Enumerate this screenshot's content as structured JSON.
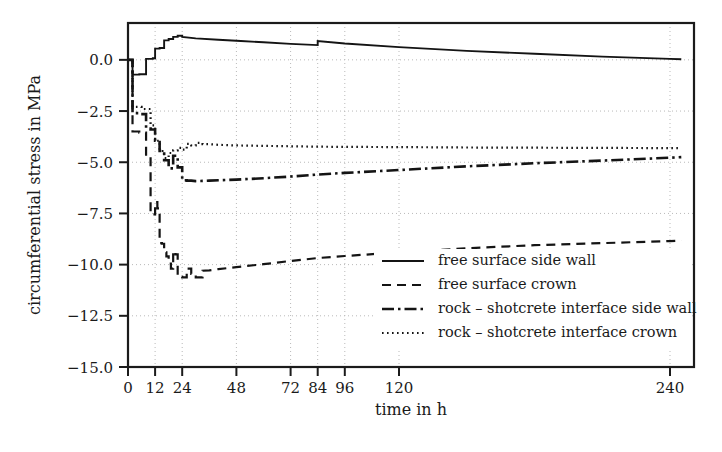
{
  "chart_data": {
    "type": "line",
    "title": "",
    "xlabel": "time in h",
    "ylabel": "circumferential stress in MPa",
    "xlim": [
      0,
      245
    ],
    "ylim": [
      -15.0,
      1.8
    ],
    "grid": true,
    "legend_position": "center-right inside axes",
    "xticks": [
      0,
      12,
      24,
      48,
      72,
      84,
      96,
      120,
      240
    ],
    "xtick_labels": [
      "0",
      "12",
      "24",
      "48",
      "72",
      "84",
      "96",
      "120",
      "240"
    ],
    "yticks": [
      0.0,
      -2.5,
      -5.0,
      -7.5,
      -10.0,
      -12.5,
      -15.0
    ],
    "ytick_labels": [
      "0.0",
      "−2.5",
      "−5.0",
      "−7.5",
      "−10.0",
      "−12.5",
      "−15.0"
    ],
    "series": [
      {
        "name": "free surface side wall",
        "style": "solid",
        "x": [
          0,
          2,
          2,
          5,
          5,
          8,
          8,
          11,
          11,
          12,
          12,
          14,
          14,
          16,
          16,
          18,
          18,
          20,
          20,
          22,
          22,
          24,
          24,
          30,
          40,
          50,
          60,
          72,
          84,
          84,
          96,
          120,
          150,
          180,
          210,
          240,
          245
        ],
        "y": [
          0.0,
          0.0,
          -0.72,
          -0.72,
          -0.7,
          -0.7,
          0.05,
          0.05,
          0.08,
          0.08,
          0.55,
          0.55,
          0.58,
          0.58,
          0.95,
          0.95,
          1.02,
          1.02,
          1.12,
          1.12,
          1.18,
          1.18,
          1.12,
          1.05,
          0.98,
          0.92,
          0.86,
          0.78,
          0.72,
          0.92,
          0.8,
          0.62,
          0.44,
          0.3,
          0.16,
          0.05,
          0.03
        ]
      },
      {
        "name": "free surface crown",
        "style": "dashed",
        "x": [
          0,
          2,
          2,
          5,
          5,
          8,
          8,
          10,
          10,
          12,
          12,
          13,
          13,
          14,
          14,
          15,
          15,
          16,
          16,
          17,
          17,
          18,
          18,
          19,
          19,
          20,
          20,
          21,
          21,
          22,
          22,
          23,
          23,
          24,
          24,
          26,
          26,
          28,
          28,
          30,
          30,
          33,
          33,
          36,
          40,
          48,
          60,
          72,
          84,
          96,
          120,
          150,
          180,
          210,
          240,
          245
        ],
        "y": [
          0.0,
          0.0,
          -3.5,
          -3.5,
          -3.55,
          -3.55,
          -4.7,
          -4.7,
          -7.55,
          -7.55,
          -6.95,
          -6.95,
          -7.25,
          -7.25,
          -8.95,
          -8.95,
          -8.98,
          -8.98,
          -9.4,
          -9.4,
          -9.6,
          -9.6,
          -9.95,
          -9.95,
          -10.2,
          -10.2,
          -9.35,
          -9.35,
          -9.5,
          -9.5,
          -10.55,
          -10.55,
          -10.6,
          -10.6,
          -10.62,
          -10.62,
          -10.2,
          -10.2,
          -10.45,
          -10.45,
          -10.62,
          -10.62,
          -10.3,
          -10.28,
          -10.22,
          -10.12,
          -9.98,
          -9.82,
          -9.68,
          -9.58,
          -9.4,
          -9.2,
          -9.05,
          -8.95,
          -8.85,
          -8.82
        ]
      },
      {
        "name": "rock – shotcrete interface side wall",
        "style": "dashdot",
        "x": [
          0,
          2,
          2,
          5,
          5,
          8,
          8,
          10,
          10,
          12,
          12,
          14,
          14,
          16,
          16,
          18,
          18,
          20,
          20,
          22,
          22,
          24,
          24,
          26,
          26,
          28,
          30,
          36,
          48,
          60,
          72,
          84,
          96,
          120,
          150,
          180,
          210,
          240,
          245
        ],
        "y": [
          0.0,
          0.0,
          -2.6,
          -2.6,
          -2.65,
          -2.65,
          -3.35,
          -3.35,
          -3.4,
          -3.4,
          -3.95,
          -3.95,
          -4.45,
          -4.45,
          -4.9,
          -4.9,
          -5.3,
          -5.3,
          -4.68,
          -4.68,
          -5.25,
          -5.25,
          -5.88,
          -5.88,
          -5.9,
          -5.9,
          -5.92,
          -5.9,
          -5.85,
          -5.78,
          -5.7,
          -5.6,
          -5.52,
          -5.38,
          -5.2,
          -5.05,
          -4.92,
          -4.78,
          -4.75
        ]
      },
      {
        "name": "rock – shotcrete interface crown",
        "style": "dotted",
        "x": [
          0,
          2,
          2,
          6,
          6,
          10,
          10,
          12,
          12,
          14,
          14,
          16,
          16,
          18,
          18,
          20,
          20,
          22,
          22,
          24,
          24,
          26,
          26,
          28,
          28,
          30,
          30,
          33,
          33,
          36,
          40,
          48,
          60,
          72,
          84,
          96,
          120,
          150,
          180,
          210,
          240,
          245
        ],
        "y": [
          0.0,
          0.0,
          -2.3,
          -2.3,
          -2.4,
          -2.4,
          -3.2,
          -3.2,
          -3.95,
          -3.95,
          -4.45,
          -4.45,
          -4.8,
          -4.8,
          -4.55,
          -4.55,
          -4.42,
          -4.42,
          -4.3,
          -4.3,
          -4.38,
          -4.38,
          -4.1,
          -4.1,
          -4.18,
          -4.18,
          -4.05,
          -4.05,
          -4.12,
          -4.12,
          -4.15,
          -4.18,
          -4.2,
          -4.22,
          -4.24,
          -4.25,
          -4.26,
          -4.28,
          -4.29,
          -4.3,
          -4.31,
          -4.31
        ]
      }
    ],
    "legend_entries": [
      {
        "label": "free surface side wall",
        "style": "solid"
      },
      {
        "label": "free surface crown",
        "style": "dashed"
      },
      {
        "label": "rock – shotcrete interface side wall",
        "style": "dashdot"
      },
      {
        "label": "rock – shotcrete interface crown",
        "style": "dotted"
      }
    ],
    "colors": {
      "line": "#141414",
      "grid": "#b9b9b9",
      "frame": "#1b1b1b",
      "text": "#1a1a1a",
      "background": "#ffffff"
    }
  }
}
